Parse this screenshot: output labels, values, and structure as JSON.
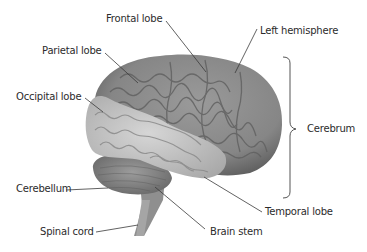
{
  "diagram": {
    "title": "",
    "labels": {
      "frontal_lobe": "Frontal lobe",
      "left_hemisphere": "Left hemisphere",
      "parietal_lobe": "Parietal lobe",
      "occipital_lobe": "Occipital lobe",
      "cerebrum": "Cerebrum",
      "cerebellum": "Cerebellum",
      "temporal_lobe": "Temporal lobe",
      "spinal_cord": "Spinal cord",
      "brain_stem": "Brain stem"
    },
    "colors": {
      "cerebrum": "#8c8c8c",
      "cerebrum_dark": "#6e6e6e",
      "temporal_occipital": "#c4c4c4",
      "cerebellum": "#8a8a8a",
      "stem": "#9a9a9a",
      "leader_line": "#3a3a3a",
      "text": "#2b2b2b"
    }
  }
}
